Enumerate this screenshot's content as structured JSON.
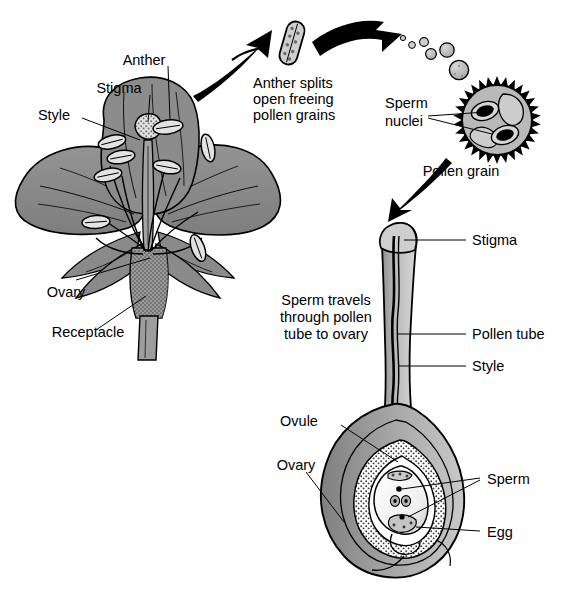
{
  "figure": {
    "colors": {
      "petal_gray": "#8c8c8c",
      "petal_dark": "#6e6e6e",
      "light_gray": "#d2d2d2",
      "pale": "#e8e8e8",
      "mid_gray": "#a8a8a8",
      "ink": "#000000",
      "white": "#ffffff",
      "stipple": "#5a5a5a"
    }
  },
  "labels": {
    "anther": "Anther",
    "stigma_flower": "Stigma",
    "style_flower": "Style",
    "ovary_flower": "Ovary",
    "receptacle": "Receptacle",
    "anther_splits_l1": "Anther splits",
    "anther_splits_l2": "open freeing",
    "anther_splits_l3": "pollen grains",
    "sperm_nuclei_l1": "Sperm",
    "sperm_nuclei_l2": "nuclei",
    "pollen_grain": "Pollen grain",
    "stigma_tube": "Stigma",
    "pollen_tube": "Pollen tube",
    "style_tube": "Style",
    "sperm_travels_l1": "Sperm travels",
    "sperm_travels_l2": "through pollen",
    "sperm_travels_l3": "tube to ovary",
    "ovule": "Ovule",
    "ovary_lower": "Ovary",
    "sperm": "Sperm",
    "egg": "Egg"
  },
  "icons": {
    "arrow_flower_to_anther": "curved-arrow-up-right-icon",
    "arrow_anther_to_pollen": "curved-arrow-right-icon",
    "arrow_pollen_to_stigma": "arrow-down-left-icon",
    "flower": "flower-diagram-icon",
    "detached_anther": "anther-icon",
    "pollen_trail": "pollen-grains-trail-icon",
    "pollen_grain_cell": "pollen-grain-icon",
    "pistil": "pistil-cutaway-icon",
    "embryo_sac": "embryo-sac-icon"
  },
  "pollen_trail": [
    {
      "cx": 403,
      "cy": 38,
      "r": 2.6
    },
    {
      "cx": 412,
      "cy": 44,
      "r": 3.4
    },
    {
      "cx": 424,
      "cy": 42,
      "r": 4.4
    },
    {
      "cx": 432,
      "cy": 53,
      "r": 5.4
    },
    {
      "cx": 446,
      "cy": 50,
      "r": 7.0
    },
    {
      "cx": 458,
      "cy": 68,
      "r": 9.5
    }
  ]
}
